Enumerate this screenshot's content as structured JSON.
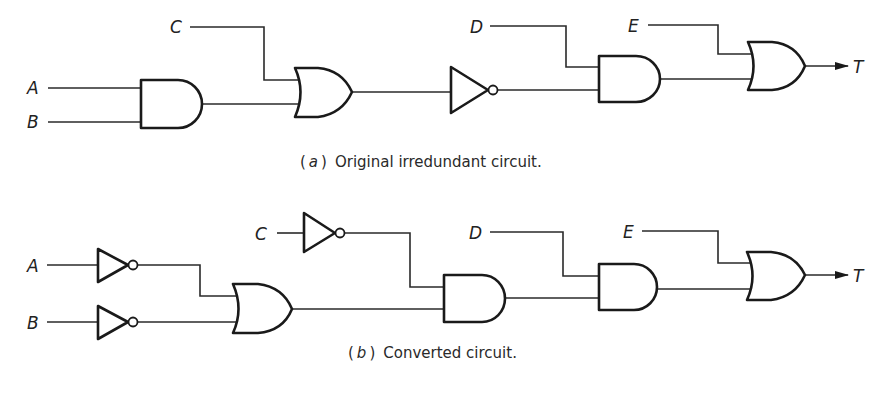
{
  "figure": {
    "circuits": [
      {
        "id": "a",
        "caption_tag": "a",
        "caption_text": "Original irredundant circuit.",
        "inputs": [
          "A",
          "B",
          "C",
          "D",
          "E"
        ],
        "output": "T",
        "gates": [
          {
            "type": "AND",
            "inputs": [
              "A",
              "B"
            ]
          },
          {
            "type": "OR",
            "inputs": [
              "C",
              "AND(A,B)"
            ]
          },
          {
            "type": "NOT",
            "inputs": [
              "OR"
            ]
          },
          {
            "type": "AND",
            "inputs": [
              "D",
              "NOT"
            ]
          },
          {
            "type": "OR",
            "inputs": [
              "E",
              "AND"
            ],
            "output": "T"
          }
        ]
      },
      {
        "id": "b",
        "caption_tag": "b",
        "caption_text": "Converted circuit.",
        "inputs": [
          "A",
          "B",
          "C",
          "D",
          "E"
        ],
        "output": "T",
        "gates": [
          {
            "type": "NOT",
            "inputs": [
              "A"
            ]
          },
          {
            "type": "NOT",
            "inputs": [
              "B"
            ]
          },
          {
            "type": "NOT",
            "inputs": [
              "C"
            ]
          },
          {
            "type": "OR",
            "inputs": [
              "NOT A",
              "NOT B"
            ]
          },
          {
            "type": "AND",
            "inputs": [
              "NOT C",
              "OR"
            ]
          },
          {
            "type": "AND",
            "inputs": [
              "D",
              "AND"
            ]
          },
          {
            "type": "OR",
            "inputs": [
              "E",
              "AND"
            ],
            "output": "T"
          }
        ]
      }
    ]
  },
  "labels": {
    "a": {
      "A": "A",
      "B": "B",
      "C": "C",
      "D": "D",
      "E": "E",
      "T": "T"
    },
    "b": {
      "A": "A",
      "B": "B",
      "C": "C",
      "D": "D",
      "E": "E",
      "T": "T"
    }
  },
  "captions": {
    "a": {
      "paren_open": "(",
      "tag": "a",
      "paren_close": ")",
      "text": "Original irredundant circuit."
    },
    "b": {
      "paren_open": "(",
      "tag": "b",
      "paren_close": ")",
      "text": "Converted circuit."
    }
  },
  "colors": {
    "line": "#1a1a1a",
    "background": "#ffffff"
  }
}
